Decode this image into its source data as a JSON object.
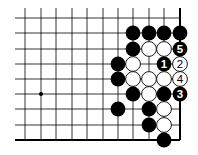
{
  "diagram": {
    "type": "go-board-fragment",
    "colors": {
      "background": "#ffffff",
      "line": "#000000",
      "black_stone": "#000000",
      "white_stone": "#ffffff",
      "black_label": "#ffffff",
      "white_label": "#000000"
    },
    "grid": {
      "columns_x": [
        25,
        41,
        56,
        72,
        87,
        103,
        118,
        133,
        149,
        164,
        180
      ],
      "rows_y": [
        18,
        33,
        49,
        64,
        79,
        94,
        109,
        125,
        140
      ],
      "left_extent_x": 15,
      "top_extent_y": 8,
      "right_edge_col": 10,
      "bottom_edge_row": 8
    },
    "star_points": [
      {
        "col": 1,
        "row": 5
      }
    ],
    "stones": [
      {
        "col": 7,
        "row": 1,
        "color": "black",
        "label": ""
      },
      {
        "col": 8,
        "row": 1,
        "color": "black",
        "label": ""
      },
      {
        "col": 9,
        "row": 1,
        "color": "black",
        "label": ""
      },
      {
        "col": 10,
        "row": 1,
        "color": "black",
        "label": ""
      },
      {
        "col": 7,
        "row": 2,
        "color": "black",
        "label": ""
      },
      {
        "col": 8,
        "row": 2,
        "color": "white",
        "label": ""
      },
      {
        "col": 9,
        "row": 2,
        "color": "white",
        "label": ""
      },
      {
        "col": 10,
        "row": 2,
        "color": "black",
        "label": "5"
      },
      {
        "col": 6,
        "row": 3,
        "color": "black",
        "label": ""
      },
      {
        "col": 7,
        "row": 3,
        "color": "white",
        "label": ""
      },
      {
        "col": 9,
        "row": 3,
        "color": "black",
        "label": "1"
      },
      {
        "col": 10,
        "row": 3,
        "color": "white",
        "label": "2"
      },
      {
        "col": 6,
        "row": 4,
        "color": "black",
        "label": ""
      },
      {
        "col": 7,
        "row": 4,
        "color": "white",
        "label": ""
      },
      {
        "col": 8,
        "row": 4,
        "color": "white",
        "label": ""
      },
      {
        "col": 9,
        "row": 4,
        "color": "white",
        "label": ""
      },
      {
        "col": 10,
        "row": 4,
        "color": "white",
        "label": "4"
      },
      {
        "col": 7,
        "row": 5,
        "color": "black",
        "label": ""
      },
      {
        "col": 8,
        "row": 5,
        "color": "white",
        "label": ""
      },
      {
        "col": 9,
        "row": 5,
        "color": "black",
        "label": ""
      },
      {
        "col": 10,
        "row": 5,
        "color": "black",
        "label": "3"
      },
      {
        "col": 6,
        "row": 6,
        "color": "black",
        "label": ""
      },
      {
        "col": 8,
        "row": 6,
        "color": "black",
        "label": ""
      },
      {
        "col": 9,
        "row": 6,
        "color": "white",
        "label": ""
      },
      {
        "col": 8,
        "row": 7,
        "color": "black",
        "label": ""
      },
      {
        "col": 9,
        "row": 7,
        "color": "white",
        "label": ""
      },
      {
        "col": 9,
        "row": 8,
        "color": "black",
        "label": ""
      }
    ]
  }
}
